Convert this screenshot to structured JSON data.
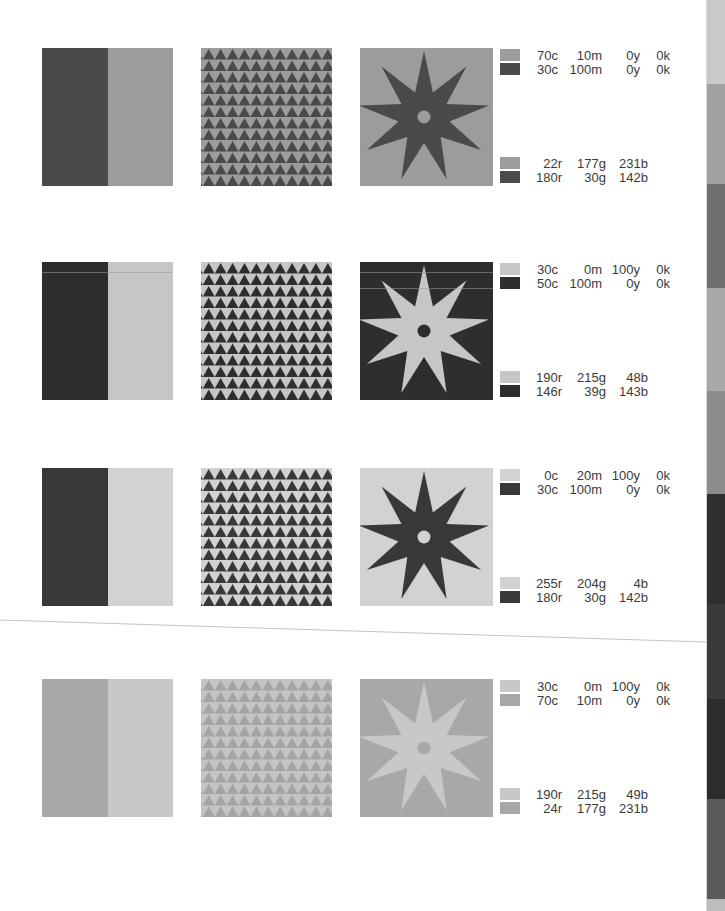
{
  "page": {
    "background": "#ffffff"
  },
  "rows": [
    {
      "top": 48,
      "colors": {
        "a": "#4a4a4a",
        "b": "#9c9c9c"
      },
      "split": {
        "left": "#4a4a4a",
        "right": "#9c9c9c"
      },
      "triangles": {
        "fg": "#4a4a4a",
        "bg": "#9c9c9c"
      },
      "star": {
        "fill": "#4a4a4a",
        "bg": "#9c9c9c",
        "dot": "#9c9c9c"
      },
      "legend": {
        "cmyk_top": {
          "swatch": "#9c9c9c",
          "c": "70c",
          "m": "10m",
          "y": "0y",
          "k": "0k"
        },
        "cmyk_bottom": {
          "swatch": "#4a4a4a",
          "c": "30c",
          "m": "100m",
          "y": "0y",
          "k": "0k"
        },
        "rgb_top": {
          "swatch": "#9c9c9c",
          "r": "22r",
          "g": "177g",
          "b": "231b"
        },
        "rgb_bottom": {
          "swatch": "#4a4a4a",
          "r": "180r",
          "g": "30g",
          "b": "142b"
        }
      }
    },
    {
      "top": 262,
      "colors": {
        "a": "#2e2e2e",
        "b": "#c6c6c6"
      },
      "split": {
        "left": "#2e2e2e",
        "right": "#c6c6c6"
      },
      "triangles": {
        "fg": "#2e2e2e",
        "bg": "#c6c6c6"
      },
      "star": {
        "fill": "#c6c6c6",
        "bg": "#2e2e2e",
        "dot": "#2e2e2e"
      },
      "legend": {
        "cmyk_top": {
          "swatch": "#c6c6c6",
          "c": "30c",
          "m": "0m",
          "y": "100y",
          "k": "0k"
        },
        "cmyk_bottom": {
          "swatch": "#2e2e2e",
          "c": "50c",
          "m": "100m",
          "y": "0y",
          "k": "0k"
        },
        "rgb_top": {
          "swatch": "#c6c6c6",
          "r": "190r",
          "g": "215g",
          "b": "48b"
        },
        "rgb_bottom": {
          "swatch": "#2e2e2e",
          "r": "146r",
          "g": "39g",
          "b": "143b"
        }
      }
    },
    {
      "top": 468,
      "colors": {
        "a": "#383838",
        "b": "#d2d2d2"
      },
      "split": {
        "left": "#383838",
        "right": "#d2d2d2"
      },
      "triangles": {
        "fg": "#383838",
        "bg": "#d2d2d2"
      },
      "star": {
        "fill": "#383838",
        "bg": "#d2d2d2",
        "dot": "#d2d2d2"
      },
      "legend": {
        "cmyk_top": {
          "swatch": "#d2d2d2",
          "c": "0c",
          "m": "20m",
          "y": "100y",
          "k": "0k"
        },
        "cmyk_bottom": {
          "swatch": "#383838",
          "c": "30c",
          "m": "100m",
          "y": "0y",
          "k": "0k"
        },
        "rgb_top": {
          "swatch": "#d2d2d2",
          "r": "255r",
          "g": "204g",
          "b": "4b"
        },
        "rgb_bottom": {
          "swatch": "#383838",
          "r": "180r",
          "g": "30g",
          "b": "142b"
        }
      }
    },
    {
      "top": 679,
      "colors": {
        "a": "#a8a8a8",
        "b": "#c8c8c8"
      },
      "split": {
        "left": "#a8a8a8",
        "right": "#c8c8c8"
      },
      "triangles": {
        "fg": "#a4a4a4",
        "bg": "#c4c4c4"
      },
      "star": {
        "fill": "#c8c8c8",
        "bg": "#a8a8a8",
        "dot": "#a8a8a8"
      },
      "legend": {
        "cmyk_top": {
          "swatch": "#c8c8c8",
          "c": "30c",
          "m": "0m",
          "y": "100y",
          "k": "0k"
        },
        "cmyk_bottom": {
          "swatch": "#a8a8a8",
          "c": "70c",
          "m": "10m",
          "y": "0y",
          "k": "0k"
        },
        "rgb_top": {
          "swatch": "#c8c8c8",
          "r": "190r",
          "g": "215g",
          "b": "49b"
        },
        "rgb_bottom": {
          "swatch": "#a8a8a8",
          "r": "24r",
          "g": "177g",
          "b": "231b"
        }
      }
    }
  ],
  "sidebar_bands": [
    {
      "top": 0,
      "height": 84,
      "color": "#c9c9c9"
    },
    {
      "top": 84,
      "height": 100,
      "color": "#a2a2a2"
    },
    {
      "top": 184,
      "height": 104,
      "color": "#6f6f6f"
    },
    {
      "top": 288,
      "height": 103,
      "color": "#a8a8a8"
    },
    {
      "top": 391,
      "height": 103,
      "color": "#8c8c8c"
    },
    {
      "top": 494,
      "height": 110,
      "color": "#2f2f2f"
    },
    {
      "top": 604,
      "height": 95,
      "color": "#3a3a3a"
    },
    {
      "top": 699,
      "height": 100,
      "color": "#2c2c2c"
    },
    {
      "top": 799,
      "height": 100,
      "color": "#5a5a5a"
    },
    {
      "top": 899,
      "height": 12,
      "color": "#bdbdbd"
    }
  ]
}
